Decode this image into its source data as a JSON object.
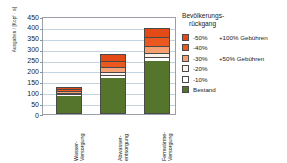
{
  "chart_data": {
    "type": "bar",
    "stacked": true,
    "title": "",
    "xlabel": "",
    "ylabel": "Ausgaben / [Kopf · a]",
    "ylim": [
      0,
      450
    ],
    "yticks": [
      0,
      50,
      100,
      150,
      200,
      250,
      300,
      350,
      400,
      450
    ],
    "grid": true,
    "legend_position": "right",
    "legend_title_line1": "Bevölkerungs-",
    "legend_title_line2": "rückgang",
    "categories": [
      {
        "line1": "Wasser-",
        "line2": "Versorgung"
      },
      {
        "line1": "Abwasser-",
        "line2": "entsorgung"
      },
      {
        "line1": "Fernwärme-",
        "line2": "Versorgung"
      }
    ],
    "series": [
      {
        "name": "Bestand",
        "color": "#55752c",
        "values": [
          83,
          165,
          243
        ]
      },
      {
        "name": "-10%",
        "color": "#ffffff",
        "values": [
          6,
          12,
          16
        ]
      },
      {
        "name": "-20%",
        "color": "#fdf2ea",
        "values": [
          6,
          13,
          18
        ]
      },
      {
        "name": "-30%",
        "color": "#f4a072",
        "values": [
          8,
          24,
          33
        ]
      },
      {
        "name": "-40%",
        "color": "#e8581f",
        "values": [
          10,
          30,
          41
        ]
      },
      {
        "name": "-50%",
        "color": "#e44a16",
        "values": [
          11,
          31,
          44
        ]
      }
    ],
    "annotations": [
      {
        "text": "+100% Gebühren",
        "attached_to": "-50%"
      },
      {
        "text": "+50% Gebühren",
        "attached_to": "-30%"
      }
    ],
    "legend_entries": [
      {
        "label": "-50%",
        "note": "+100% Gebühren",
        "color": "#e44a16"
      },
      {
        "label": "-40%",
        "note": "",
        "color": "#e8581f"
      },
      {
        "label": "-30%",
        "note": "+50% Gebühren",
        "color": "#f4a072"
      },
      {
        "label": "-20%",
        "note": "",
        "color": "#fdf2ea"
      },
      {
        "label": "-10%",
        "note": "",
        "color": "#ffffff"
      },
      {
        "label": "Bestand",
        "note": "",
        "color": "#55752c"
      }
    ]
  }
}
